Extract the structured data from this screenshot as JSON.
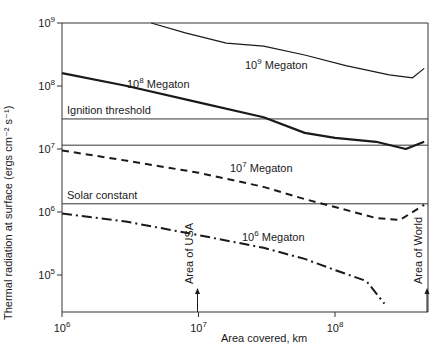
{
  "chart_data": {
    "type": "line",
    "title": "",
    "xlabel": "Area covered, km",
    "ylabel": "Thermal radiation at surface (ergs cm⁻² s⁻¹)",
    "xscale": "log",
    "yscale": "log",
    "xlim": [
      1000000,
      450000000
    ],
    "ylim": [
      30000,
      1000000000
    ],
    "x_ticks": [
      {
        "value": 1000000,
        "label": "10",
        "exp": "6"
      },
      {
        "value": 10000000,
        "label": "10",
        "exp": "7"
      },
      {
        "value": 100000000,
        "label": "10",
        "exp": "8"
      }
    ],
    "y_ticks": [
      {
        "value": 1000000000,
        "label": "10",
        "exp": "9"
      },
      {
        "value": 100000000,
        "label": "10",
        "exp": "8"
      },
      {
        "value": 10000000,
        "label": "10",
        "exp": "7"
      },
      {
        "value": 1000000,
        "label": "10",
        "exp": "6"
      },
      {
        "value": 100000,
        "label": "10",
        "exp": "5"
      }
    ],
    "grid": false,
    "legend": "inline labels",
    "series": [
      {
        "name": "10^9 Megaton",
        "label": "10",
        "exp": "9",
        "label_suffix": " Megaton",
        "style": "solid",
        "width": 1.2,
        "x": [
          4500000,
          8000000,
          16000000,
          30000000,
          60000000,
          120000000,
          250000000,
          370000000,
          450000000
        ],
        "y": [
          1000000000,
          700000000,
          480000000,
          430000000,
          310000000,
          210000000,
          150000000,
          135000000,
          190000000
        ]
      },
      {
        "name": "10^8 Megaton",
        "label": "10",
        "exp": "8",
        "label_suffix": " Megaton",
        "style": "solid",
        "width": 2.2,
        "x": [
          1000000,
          3000000,
          10000000,
          30000000,
          60000000,
          100000000,
          200000000,
          330000000,
          450000000
        ],
        "y": [
          160000000,
          100000000,
          55000000,
          32000000,
          18000000,
          15000000,
          13000000,
          10000000,
          13000000
        ]
      },
      {
        "name": "10^7 Megaton",
        "label": "10",
        "exp": "7",
        "label_suffix": " Megaton",
        "style": "dashed",
        "width": 2,
        "x": [
          1000000,
          3000000,
          10000000,
          30000000,
          60000000,
          100000000,
          200000000,
          300000000,
          450000000
        ],
        "y": [
          9500000,
          6500000,
          4200000,
          2500000,
          1600000,
          1200000,
          800000,
          750000,
          1300000
        ]
      },
      {
        "name": "10^6 Megaton",
        "label": "10",
        "exp": "6",
        "label_suffix": " Megaton",
        "style": "dashdot",
        "width": 2,
        "x": [
          1000000,
          3000000,
          10000000,
          30000000,
          60000000,
          100000000,
          170000000,
          230000000
        ],
        "y": [
          950000,
          700000,
          430000,
          270000,
          180000,
          120000,
          80000,
          35000
        ]
      }
    ],
    "reference_lines": [
      {
        "name": "Ignition threshold",
        "y": 30000000,
        "label": "Ignition threshold"
      },
      {
        "name": "Ignition upper bound",
        "y": 11500000,
        "label": ""
      },
      {
        "name": "Solar constant",
        "y": 1350000,
        "label": "Solar constant"
      }
    ],
    "annotations": [
      {
        "text": "Area of USA",
        "x": 10000000,
        "type": "vertical-arrow"
      },
      {
        "text": "Area of World",
        "x": 450000000,
        "type": "vertical-arrow"
      }
    ]
  },
  "labels": {
    "xlabel": "Area covered, km",
    "ylabel": "Thermal radiation at surface (ergs cm⁻² s⁻¹)",
    "ignition": "Ignition threshold",
    "solar": "Solar constant",
    "usa": "Area of USA",
    "world": "Area of World"
  },
  "colors": {
    "line": "#1a1a1a",
    "axis": "#333333",
    "background": "#ffffff"
  }
}
